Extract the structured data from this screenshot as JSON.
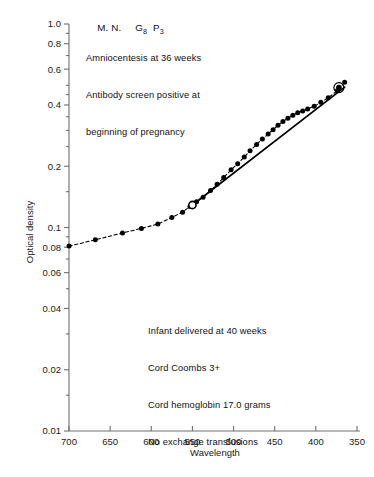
{
  "chart_data": {
    "type": "line",
    "title": "",
    "xlabel": "Wavelength",
    "ylabel": "Optical density",
    "yscale": "log",
    "ylim": [
      0.01,
      1.0
    ],
    "xlim": [
      700,
      350
    ],
    "x_reversed": true,
    "grid": false,
    "legend": "none",
    "x_ticks": [
      700,
      650,
      600,
      550,
      500,
      450,
      400,
      350
    ],
    "x_tick_labels": [
      "700",
      "650",
      "600",
      "550",
      "500",
      "450",
      "400",
      "350"
    ],
    "y_ticks": [
      1.0,
      0.8,
      0.6,
      0.4,
      0.2,
      0.1,
      0.08,
      0.06,
      0.04,
      0.02,
      0.01
    ],
    "y_tick_labels": [
      "1.0",
      "0.8",
      "0.6",
      "0.4",
      "0.2",
      "0.1",
      "0.08",
      "0.06",
      "0.04",
      "0.02",
      "0.01"
    ],
    "series": [
      {
        "name": "Optical density scan",
        "style": "dashed-with-markers",
        "marker": "filled-circle",
        "x": [
          700,
          668,
          635,
          612,
          592,
          575,
          562,
          553,
          545,
          537,
          528,
          520,
          512,
          503,
          495,
          487,
          480,
          472,
          465,
          458,
          452,
          446,
          440,
          434,
          428,
          422,
          416,
          410,
          402,
          394,
          385,
          374,
          365
        ],
        "y": [
          0.081,
          0.087,
          0.094,
          0.099,
          0.104,
          0.112,
          0.119,
          0.127,
          0.134,
          0.141,
          0.152,
          0.163,
          0.176,
          0.192,
          0.206,
          0.222,
          0.238,
          0.256,
          0.272,
          0.288,
          0.302,
          0.318,
          0.332,
          0.344,
          0.356,
          0.366,
          0.374,
          0.382,
          0.394,
          0.412,
          0.434,
          0.47,
          0.518
        ]
      },
      {
        "name": "Liley baseline (straight line)",
        "style": "solid",
        "marker": "none",
        "x": [
          550,
          365
        ],
        "y": [
          0.129,
          0.49
        ]
      }
    ],
    "special_markers": [
      {
        "name": "open-circle-anchor",
        "x": 550,
        "y": 0.129,
        "marker": "open-circle"
      },
      {
        "name": "ringed-endpoint",
        "x": 372,
        "y": 0.487,
        "marker": "ringed-filled-circle"
      }
    ],
    "annotations": {
      "patient_line": {
        "initials": "M. N.",
        "gravida": "G",
        "gravida_sub": "8",
        "para": "P",
        "para_sub": "3"
      },
      "upper_note": [
        "Amniocentesis at 36 weeks",
        "Antibody screen positive at",
        "beginning of pregnancy"
      ],
      "lower_note": [
        "Infant delivered at 40 weeks",
        "Cord Coombs 3+",
        "Cord hemoglobin 17.0 grams",
        "No exchange transfusions"
      ]
    }
  },
  "colors": {
    "ink": "#000000",
    "axis": "#6e6e6e",
    "background": "#ffffff"
  }
}
